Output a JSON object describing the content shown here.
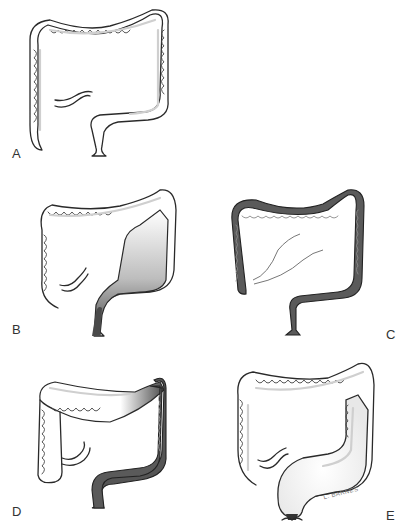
{
  "figure": {
    "panels": [
      {
        "id": "A",
        "label": "A",
        "description": "Normal colon"
      },
      {
        "id": "B",
        "label": "B",
        "description": "Colon with narrowed, darkened rectal segment and dilated proximal colon"
      },
      {
        "id": "C",
        "label": "C",
        "description": "Entire colon darkly shaded"
      },
      {
        "id": "D",
        "label": "D",
        "description": "Dark shading from splenic flexure through rectum, transition zone in transverse colon"
      },
      {
        "id": "E",
        "label": "E",
        "description": "Dilated colon and rectum"
      }
    ],
    "signature": "L. BARNES",
    "colors": {
      "outline": "#2a2a2a",
      "affected_segment": "#5a5a5a",
      "background": "#ffffff"
    }
  }
}
